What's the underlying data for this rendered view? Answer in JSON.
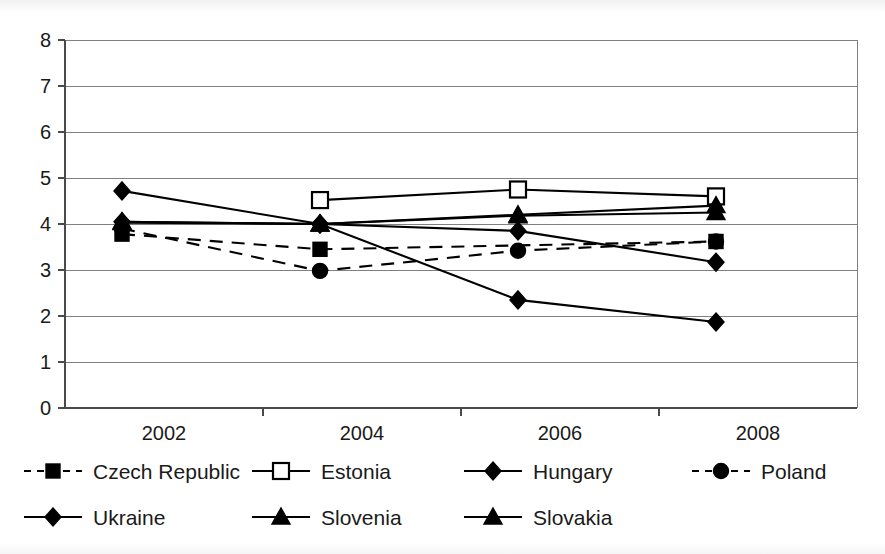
{
  "chart_data": {
    "type": "line",
    "title": "",
    "subtitle": "",
    "xlabel": "",
    "ylabel": "",
    "categories": [
      "2002",
      "2004",
      "2006",
      "2008"
    ],
    "x_tick_labels": [
      "2002",
      "2004",
      "2006",
      "2008"
    ],
    "y_tick_labels": [
      "0",
      "1",
      "2",
      "3",
      "4",
      "5",
      "6",
      "7",
      "8"
    ],
    "ylim": [
      0,
      8
    ],
    "y_tick_step": 1,
    "grid": "horizontal",
    "legend_position": "bottom",
    "legend_columns": 4,
    "series": [
      {
        "name": "Czech Republic",
        "marker": "filled-square",
        "line_style": "dashed",
        "values": [
          3.78,
          3.45,
          null,
          3.62
        ]
      },
      {
        "name": "Estonia",
        "marker": "hollow-square",
        "line_style": "solid",
        "values": [
          null,
          4.52,
          4.75,
          4.6
        ]
      },
      {
        "name": "Hungary",
        "marker": "filled-diamond",
        "line_style": "solid",
        "values": [
          4.05,
          4.0,
          3.85,
          3.17
        ]
      },
      {
        "name": "Poland",
        "marker": "filled-circle",
        "line_style": "dashed",
        "values": [
          3.9,
          2.98,
          3.42,
          3.62
        ]
      },
      {
        "name": "Ukraine",
        "marker": "filled-diamond",
        "line_style": "solid",
        "values": [
          4.72,
          4.0,
          2.35,
          1.87
        ]
      },
      {
        "name": "Slovenia",
        "marker": "filled-triangle",
        "line_style": "solid",
        "values": [
          4.05,
          4.0,
          4.2,
          4.4
        ]
      },
      {
        "name": "Slovakia",
        "marker": "filled-triangle",
        "line_style": "solid",
        "values": [
          4.03,
          4.0,
          4.18,
          4.25
        ]
      }
    ]
  },
  "legend": {
    "rows": [
      [
        {
          "label": "Czech Republic",
          "marker": "filled-square",
          "line_style": "dashed"
        },
        {
          "label": "Estonia",
          "marker": "hollow-square",
          "line_style": "solid"
        },
        {
          "label": "Hungary",
          "marker": "filled-diamond",
          "line_style": "solid"
        },
        {
          "label": "Poland",
          "marker": "filled-circle",
          "line_style": "dashed"
        }
      ],
      [
        {
          "label": "Ukraine",
          "marker": "filled-diamond",
          "line_style": "solid"
        },
        {
          "label": "Slovenia",
          "marker": "filled-triangle",
          "line_style": "solid"
        },
        {
          "label": "Slovakia",
          "marker": "filled-triangle",
          "line_style": "solid"
        }
      ]
    ]
  },
  "colors": {
    "series": "#000000",
    "gridline": "#808080",
    "axis": "#4a4a4a",
    "background": "#ffffff",
    "text": "#1a1a1a"
  }
}
